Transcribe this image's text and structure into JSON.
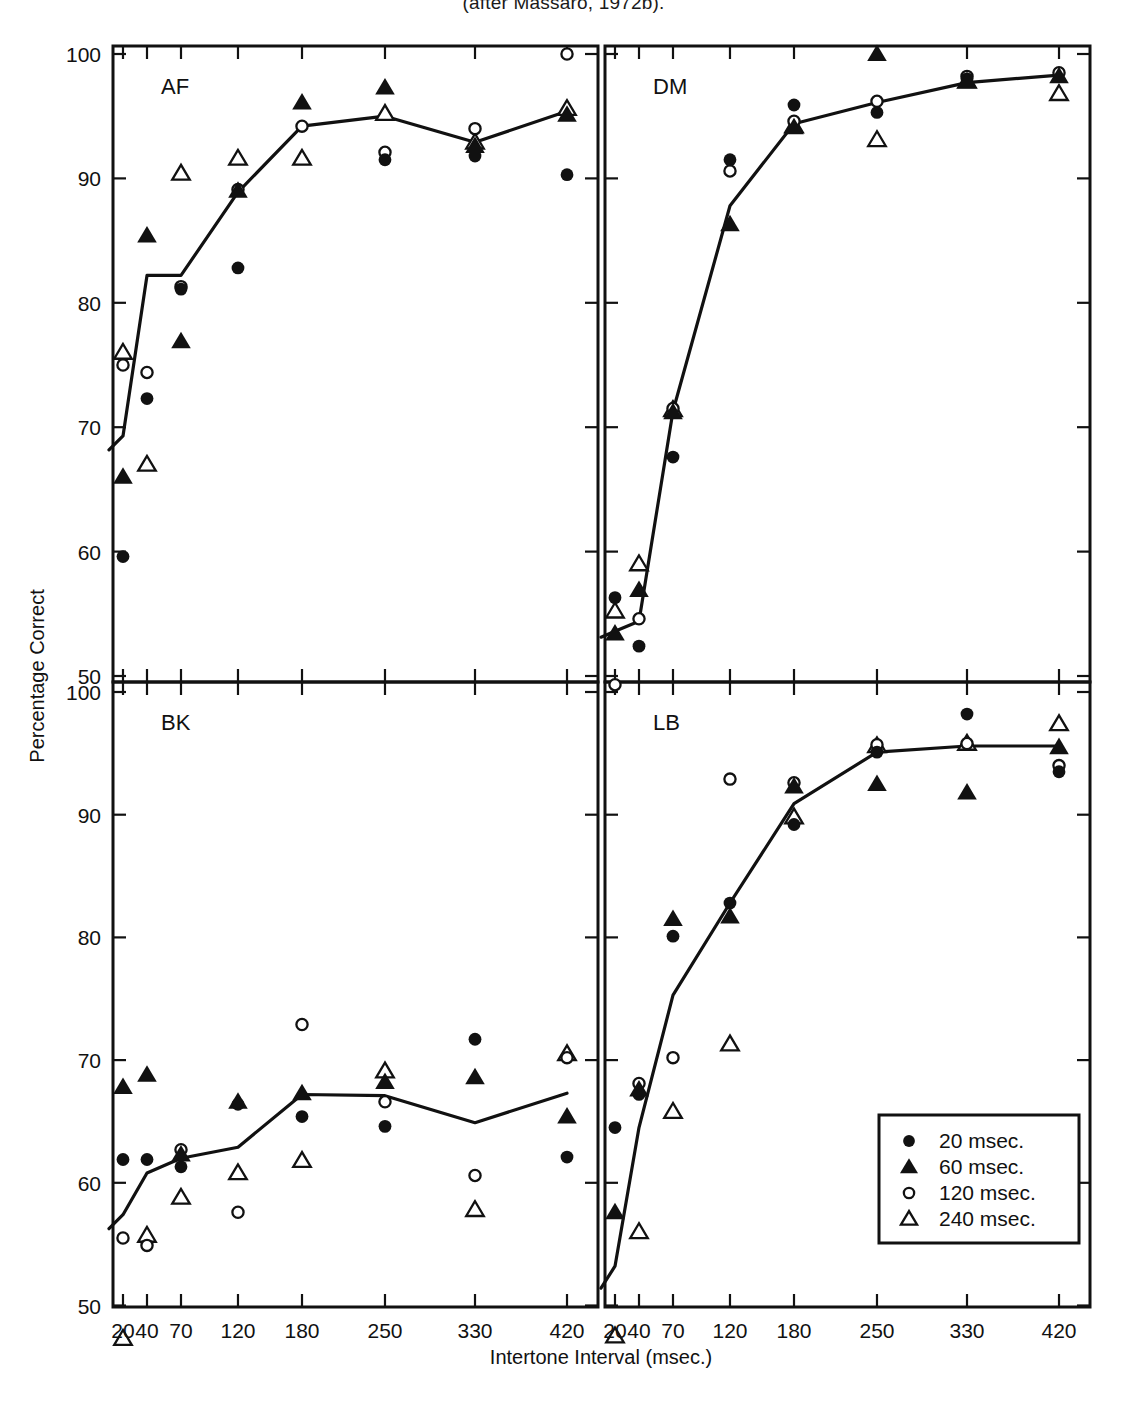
{
  "caption": "(after Massaro, 1972b).",
  "axes": {
    "x_title": "Intertone Interval (msec.)",
    "y_title": "Percentage Correct",
    "x_ticks": [
      20,
      40,
      70,
      120,
      180,
      250,
      330,
      420
    ],
    "x_tick_labels": [
      "20",
      "40",
      "70",
      "120",
      "180",
      "250",
      "330",
      "420"
    ],
    "y_ticks": [
      50,
      60,
      70,
      80,
      90,
      100
    ],
    "y_tick_labels": [
      "50",
      "60",
      "70",
      "80",
      "90",
      "100"
    ],
    "ylim": [
      47,
      101
    ],
    "grid": false
  },
  "legend": {
    "position": "bottom-right-of-LB-panel",
    "entries": [
      {
        "marker": "filled-circle",
        "label": "20 msec."
      },
      {
        "marker": "filled-triangle",
        "label": "60 msec."
      },
      {
        "marker": "open-circle",
        "label": "120 msec."
      },
      {
        "marker": "open-triangle",
        "label": "240 msec."
      }
    ]
  },
  "panels": [
    {
      "id": "AF",
      "label": "AF",
      "row": 0,
      "col": 0
    },
    {
      "id": "DM",
      "label": "DM",
      "row": 0,
      "col": 1
    },
    {
      "id": "BK",
      "label": "BK",
      "row": 1,
      "col": 0
    },
    {
      "id": "LB",
      "label": "LB",
      "row": 1,
      "col": 1
    }
  ],
  "chart_data": {
    "type": "scatter",
    "title": "",
    "subtitle": "",
    "xlabel": "Intertone Interval (msec.)",
    "ylabel": "Percentage Correct",
    "x": [
      20,
      40,
      70,
      120,
      180,
      250,
      330,
      420
    ],
    "xlim": [
      14,
      440
    ],
    "ylim": [
      47,
      101
    ],
    "x_scale": "ordinal-spaced",
    "legend": [
      "20 msec.",
      "60 msec.",
      "120 msec.",
      "240 msec."
    ],
    "panels": [
      {
        "name": "AF",
        "series": [
          {
            "name": "20 msec.",
            "marker": "filled-circle",
            "values": [
              59.6,
              72.3,
              81.1,
              82.8,
              null,
              91.5,
              91.8,
              90.3
            ]
          },
          {
            "name": "60 msec.",
            "marker": "filled-triangle",
            "values": [
              66.0,
              85.4,
              76.9,
              89.0,
              96.1,
              97.3,
              92.6,
              95.1
            ]
          },
          {
            "name": "120 msec.",
            "marker": "open-circle",
            "values": [
              75.0,
              74.4,
              81.3,
              89.1,
              94.2,
              92.1,
              94.0,
              100.0
            ]
          },
          {
            "name": "240 msec.",
            "marker": "open-triangle",
            "values": [
              76.0,
              67.0,
              90.4,
              91.6,
              91.6,
              95.2,
              92.9,
              95.6
            ]
          },
          {
            "name": "mean",
            "marker": "line",
            "values": [
              69.3,
              82.2,
              82.2,
              88.9,
              94.2,
              95.0,
              92.9,
              95.4
            ]
          }
        ]
      },
      {
        "name": "DM",
        "series": [
          {
            "name": "20 msec.",
            "marker": "filled-circle",
            "values": [
              56.3,
              52.4,
              67.6,
              91.5,
              95.9,
              95.3,
              98.0,
              null
            ]
          },
          {
            "name": "60 msec.",
            "marker": "filled-triangle",
            "values": [
              53.4,
              56.9,
              71.2,
              86.3,
              94.1,
              100.0,
              97.8,
              98.2
            ]
          },
          {
            "name": "120 msec.",
            "marker": "open-circle",
            "values": [
              49.3,
              54.6,
              71.5,
              90.6,
              94.6,
              96.2,
              98.2,
              98.5
            ]
          },
          {
            "name": "240 msec.",
            "marker": "open-triangle",
            "values": [
              55.2,
              59.0,
              71.4,
              null,
              94.2,
              93.1,
              97.8,
              96.8
            ]
          },
          {
            "name": "mean",
            "marker": "line",
            "values": [
              53.6,
              54.4,
              71.3,
              87.8,
              94.4,
              96.1,
              97.7,
              98.3
            ]
          }
        ]
      },
      {
        "name": "BK",
        "series": [
          {
            "name": "20 msec.",
            "marker": "filled-circle",
            "values": [
              61.9,
              61.9,
              61.3,
              66.4,
              65.4,
              64.6,
              71.7,
              62.1
            ]
          },
          {
            "name": "60 msec.",
            "marker": "filled-triangle",
            "values": [
              67.8,
              68.8,
              62.3,
              66.6,
              67.3,
              68.2,
              68.6,
              65.4
            ]
          },
          {
            "name": "120 msec.",
            "marker": "open-circle",
            "values": [
              55.5,
              54.9,
              62.7,
              57.6,
              72.9,
              66.6,
              60.6,
              70.2
            ]
          },
          {
            "name": "240 msec.",
            "marker": "open-triangle",
            "values": [
              47.3,
              55.7,
              58.8,
              60.8,
              61.8,
              69.1,
              57.8,
              70.5
            ]
          },
          {
            "name": "mean",
            "marker": "line",
            "values": [
              57.4,
              60.8,
              62.0,
              62.9,
              67.2,
              67.1,
              64.9,
              67.3
            ]
          }
        ]
      },
      {
        "name": "LB",
        "series": [
          {
            "name": "20 msec.",
            "marker": "filled-circle",
            "values": [
              64.5,
              67.2,
              80.1,
              82.8,
              89.2,
              95.1,
              98.2,
              93.5
            ]
          },
          {
            "name": "60 msec.",
            "marker": "filled-triangle",
            "values": [
              57.6,
              67.6,
              81.5,
              81.7,
              92.3,
              92.5,
              91.8,
              95.5
            ]
          },
          {
            "name": "120 msec.",
            "marker": "open-circle",
            "values": [
              null,
              68.1,
              70.2,
              92.9,
              92.6,
              95.7,
              95.8,
              94.0
            ]
          },
          {
            "name": "240 msec.",
            "marker": "open-triangle",
            "values": [
              47.5,
              56.0,
              65.8,
              71.3,
              89.8,
              95.6,
              95.8,
              97.4
            ]
          },
          {
            "name": "mean",
            "marker": "line",
            "values": [
              53.2,
              64.5,
              75.3,
              82.8,
              90.9,
              95.1,
              95.6,
              95.6
            ]
          }
        ]
      }
    ]
  }
}
